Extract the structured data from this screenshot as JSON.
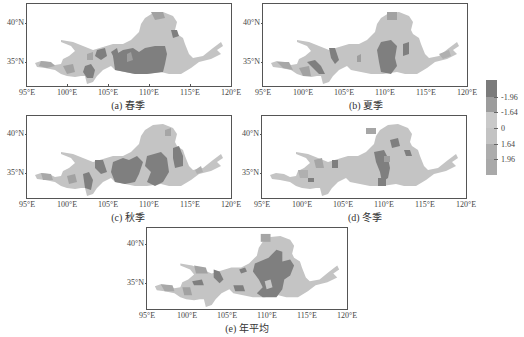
{
  "figure": {
    "x_ticks": [
      "95°E",
      "100°E",
      "105°E",
      "110°E",
      "115°E",
      "120°E"
    ],
    "y_ticks": [
      "40°N",
      "35°N"
    ],
    "panels": [
      {
        "id": "a",
        "caption": "(a) 春季"
      },
      {
        "id": "b",
        "caption": "(b) 夏季"
      },
      {
        "id": "c",
        "caption": "(c) 秋季"
      },
      {
        "id": "d",
        "caption": "(d) 冬季"
      },
      {
        "id": "e",
        "caption": "(e) 年平均"
      }
    ],
    "legend": {
      "labels": [
        "-1.96",
        "-1.64",
        "0",
        "1.64",
        "1.96"
      ],
      "colors": [
        "#7b7b7b",
        "#9c9c9c",
        "#c9c9c9",
        "#c3c3c3",
        "#adadad",
        "#a9a9a9"
      ]
    },
    "colors": {
      "base": "#c4c4c4",
      "dark": "#7f7f7f",
      "mid": "#9e9e9e",
      "light": "#b0b0b0",
      "frame": "#555555"
    }
  }
}
